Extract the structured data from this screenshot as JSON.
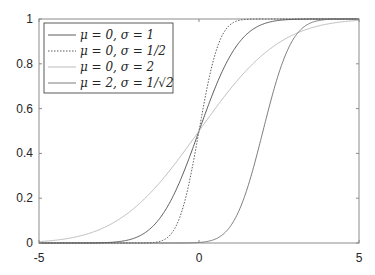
{
  "chart_data": {
    "type": "line",
    "title": "",
    "xlabel": "",
    "ylabel": "",
    "xlim": [
      -5,
      5
    ],
    "ylim": [
      0,
      1
    ],
    "xticks": [
      -5,
      0,
      5
    ],
    "xtick_labels": [
      "-5",
      "0",
      "5"
    ],
    "yticks": [
      0,
      0.2,
      0.4,
      0.6,
      0.8,
      1
    ],
    "ytick_labels": [
      "0",
      "0.2",
      "0.4",
      "0.6",
      "0.8",
      "1"
    ],
    "grid": false,
    "legend_position": "upper left",
    "series": [
      {
        "name": "μ = 0, σ = 1",
        "mu": 0,
        "sigma": 1,
        "line_style": "solid",
        "color": "#4a4a4a",
        "x": [
          -5,
          -3,
          -2,
          -1,
          0,
          1,
          2,
          3,
          5
        ],
        "values": [
          0.0,
          0.001,
          0.023,
          0.159,
          0.5,
          0.841,
          0.977,
          0.999,
          1.0
        ]
      },
      {
        "name": "μ = 0, σ = 1/2",
        "mu": 0,
        "sigma": 0.5,
        "line_style": "dotted",
        "color": "#4a4a4a",
        "x": [
          -5,
          -1.5,
          -1,
          -0.5,
          0,
          0.5,
          1,
          1.5,
          5
        ],
        "values": [
          0.0,
          0.001,
          0.023,
          0.159,
          0.5,
          0.841,
          0.977,
          0.999,
          1.0
        ]
      },
      {
        "name": "μ = 0, σ = 2",
        "mu": 0,
        "sigma": 2,
        "line_style": "solid",
        "color": "#b4b4b4",
        "x": [
          -5,
          -4,
          -2,
          0,
          2,
          4,
          5
        ],
        "values": [
          0.006,
          0.023,
          0.159,
          0.5,
          0.841,
          0.977,
          0.994
        ]
      },
      {
        "name": "μ = 2, σ = 1/√2",
        "mu": 2,
        "sigma": 0.7071,
        "line_style": "solid",
        "color": "#6e6e6e",
        "x": [
          -5,
          0,
          1,
          2,
          3,
          4,
          5
        ],
        "values": [
          0.0,
          0.002,
          0.079,
          0.5,
          0.921,
          0.998,
          1.0
        ]
      }
    ]
  },
  "legend": {
    "entries": [
      {
        "label": "μ = 0, σ = 1"
      },
      {
        "label": "μ = 0, σ = 1/2"
      },
      {
        "label": "μ = 0, σ = 2"
      },
      {
        "label": "μ = 2, σ = 1/√2"
      }
    ]
  }
}
